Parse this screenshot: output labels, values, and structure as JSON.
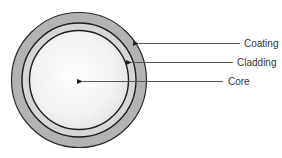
{
  "diagram": {
    "layers": [
      {
        "name": "Coating",
        "label": "Coating",
        "color": "#b3b3b3",
        "radius": 67
      },
      {
        "name": "Cladding",
        "label": "Cladding",
        "color": "#d6d6d6",
        "radius": 57
      },
      {
        "name": "Core",
        "label": "Core",
        "color": "#f4f4f4",
        "radius": 49
      }
    ],
    "labels": {
      "coating": "Coating",
      "cladding": "Cladding",
      "core": "Core"
    },
    "colors": {
      "stroke": "#1e1e1e",
      "arrow": "#444444",
      "text": "#333333"
    }
  }
}
